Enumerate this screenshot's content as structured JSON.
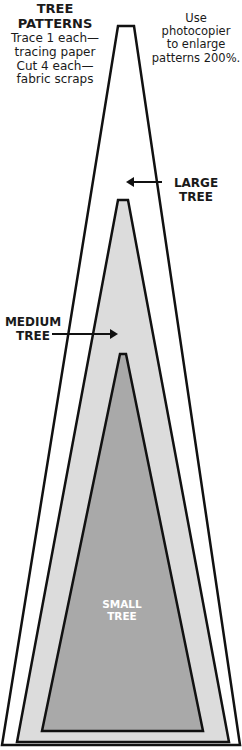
{
  "header": {
    "title_line1": "TREE",
    "title_line2": "PATTERNS",
    "instructions": [
      "Trace 1 each—",
      "tracing paper",
      "Cut 4 each—",
      "fabric scraps"
    ],
    "note": [
      "Use photocopier",
      "to enlarge",
      "patterns 200%."
    ]
  },
  "labels": {
    "large": [
      "LARGE",
      "TREE"
    ],
    "medium": [
      "MEDIUM",
      "TREE"
    ],
    "small": [
      "SMALL",
      "TREE"
    ]
  },
  "colors": {
    "outline": "#111111",
    "large_fill": "#ffffff",
    "medium_fill": "#dcdcdc",
    "small_fill": "#a9a9a9",
    "small_label": "#ffffff"
  }
}
